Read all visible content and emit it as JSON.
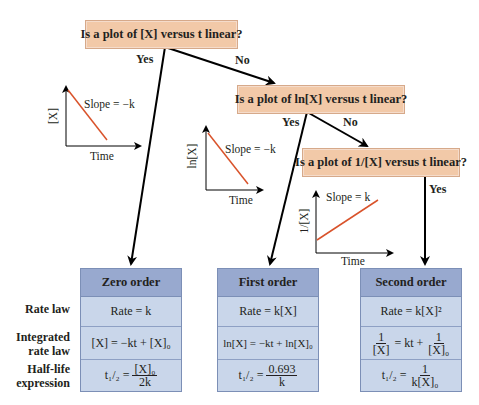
{
  "questions": {
    "q1": "Is a plot of [X] versus t linear?",
    "q2": "Is a plot of ln[X] versus t linear?",
    "q3": "Is a plot of 1/[X] versus t linear?"
  },
  "branches": {
    "q1_yes": "Yes",
    "q1_no": "No",
    "q2_yes": "Yes",
    "q2_no": "No",
    "q3_yes": "Yes"
  },
  "plots": {
    "zero": {
      "y_label": "[X]",
      "x_label": "Time",
      "slope": "Slope = −k"
    },
    "first": {
      "y_label": "ln[X]",
      "x_label": "Time",
      "slope": "Slope = −k"
    },
    "second": {
      "y_label": "1/[X]",
      "x_label": "Time",
      "slope": "Slope = k"
    }
  },
  "row_labels": {
    "rate_law": "Rate law",
    "integrated_1": "Integrated",
    "integrated_2": "rate law",
    "half_1": "Half-life",
    "half_2": "expression"
  },
  "tables": {
    "zero": {
      "title": "Zero order",
      "rate": "Rate = k",
      "integrated": "[X] = −kt + [X]₀",
      "half_num": "[X]₀",
      "half_den": "2k"
    },
    "first": {
      "title": "First order",
      "rate": "Rate = k[X]",
      "integrated": "ln[X] = −kt + ln[X]₀",
      "half_num": "0.693",
      "half_den": "k"
    },
    "second": {
      "title": "Second order",
      "rate": "Rate = k[X]²",
      "int_num1": "1",
      "int_den1": "[X]",
      "int_mid": "= kt +",
      "int_num2": "1",
      "int_den2": "[X]₀",
      "half_num": "1",
      "half_den": "k[X]₀"
    }
  },
  "half_life_prefix": "t₁/₂ =",
  "colors": {
    "question_fill": "#f2c9a8",
    "table_header": "#98a9cf",
    "table_body": "#c9d6ea",
    "plot_line": "#d9532b"
  }
}
